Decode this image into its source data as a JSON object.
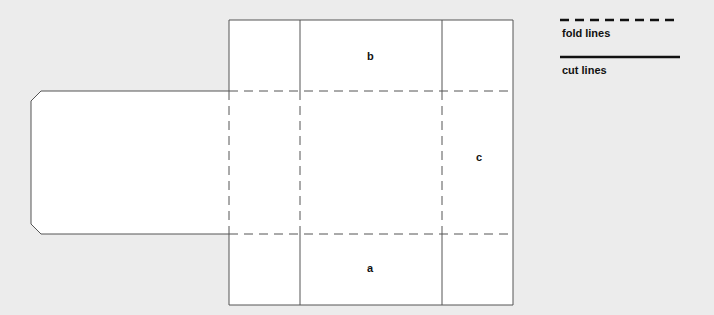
{
  "diagram": {
    "type": "box-net",
    "panel_labels": {
      "top": "b",
      "right": "c",
      "bottom": "a"
    }
  },
  "legend": {
    "items": [
      {
        "style": "dashed",
        "label": "fold lines"
      },
      {
        "style": "solid",
        "label": "cut lines"
      }
    ]
  },
  "colors": {
    "background": "#ececec",
    "panel_fill": "#ffffff",
    "line": "#555555",
    "legend_line": "#111111"
  }
}
